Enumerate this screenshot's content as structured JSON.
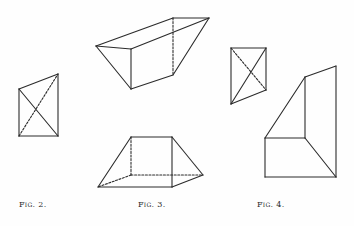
{
  "figures": [
    {
      "id": "fig2",
      "caption": "Fig. 2.",
      "caption_pos": {
        "x": 19,
        "y": 200
      },
      "solid": [
        [
          [
            19,
            89
          ],
          [
            58,
            74
          ]
        ],
        [
          [
            58,
            74
          ],
          [
            58,
            136
          ]
        ],
        [
          [
            58,
            136
          ],
          [
            19,
            136
          ]
        ],
        [
          [
            19,
            136
          ],
          [
            19,
            89
          ]
        ],
        [
          [
            19,
            89
          ],
          [
            58,
            136
          ]
        ]
      ],
      "dashed": [
        [
          [
            19,
            136
          ],
          [
            58,
            74
          ]
        ]
      ]
    },
    {
      "id": "fig3-top",
      "solid": [
        [
          [
            96,
            46
          ],
          [
            173,
            18
          ]
        ],
        [
          [
            173,
            18
          ],
          [
            209,
            18
          ]
        ],
        [
          [
            96,
            46
          ],
          [
            131,
            49
          ]
        ],
        [
          [
            131,
            49
          ],
          [
            209,
            18
          ]
        ],
        [
          [
            131,
            49
          ],
          [
            131,
            89
          ]
        ],
        [
          [
            96,
            46
          ],
          [
            131,
            89
          ]
        ],
        [
          [
            131,
            89
          ],
          [
            173,
            75
          ]
        ],
        [
          [
            173,
            75
          ],
          [
            209,
            18
          ]
        ]
      ],
      "dashed": [
        [
          [
            173,
            18
          ],
          [
            173,
            75
          ]
        ]
      ]
    },
    {
      "id": "fig3-bottom",
      "caption": "Fig. 3.",
      "caption_pos": {
        "x": 138,
        "y": 200
      },
      "solid": [
        [
          [
            131,
            137
          ],
          [
            172,
            137
          ]
        ],
        [
          [
            131,
            137
          ],
          [
            98,
            187
          ]
        ],
        [
          [
            172,
            137
          ],
          [
            172,
            187
          ]
        ],
        [
          [
            172,
            137
          ],
          [
            203,
            175
          ]
        ],
        [
          [
            98,
            187
          ],
          [
            172,
            187
          ]
        ],
        [
          [
            172,
            187
          ],
          [
            203,
            175
          ]
        ]
      ],
      "dashed": [
        [
          [
            131,
            137
          ],
          [
            131,
            175
          ]
        ],
        [
          [
            131,
            175
          ],
          [
            203,
            175
          ]
        ],
        [
          [
            131,
            175
          ],
          [
            98,
            187
          ]
        ]
      ]
    },
    {
      "id": "fig4-small",
      "solid": [
        [
          [
            231,
            48
          ],
          [
            266,
            48
          ]
        ],
        [
          [
            266,
            48
          ],
          [
            266,
            90
          ]
        ],
        [
          [
            266,
            90
          ],
          [
            231,
            104
          ]
        ],
        [
          [
            231,
            104
          ],
          [
            231,
            48
          ]
        ],
        [
          [
            266,
            48
          ],
          [
            231,
            104
          ]
        ]
      ],
      "dashed": [
        [
          [
            231,
            48
          ],
          [
            266,
            90
          ]
        ]
      ]
    },
    {
      "id": "fig4-large",
      "caption": "Fig. 4.",
      "caption_pos": {
        "x": 257,
        "y": 200
      },
      "solid": [
        [
          [
            305,
            77
          ],
          [
            336,
            66
          ]
        ],
        [
          [
            336,
            66
          ],
          [
            336,
            177
          ]
        ],
        [
          [
            336,
            177
          ],
          [
            265,
            177
          ]
        ],
        [
          [
            265,
            177
          ],
          [
            265,
            138
          ]
        ],
        [
          [
            265,
            138
          ],
          [
            305,
            77
          ]
        ],
        [
          [
            305,
            77
          ],
          [
            305,
            138
          ]
        ],
        [
          [
            305,
            138
          ],
          [
            265,
            138
          ]
        ],
        [
          [
            305,
            138
          ],
          [
            336,
            177
          ]
        ]
      ],
      "dashed": []
    }
  ],
  "style": {
    "stroke": "#2b2b2b",
    "stroke_width": 1.1,
    "dash": "2,1.6"
  }
}
